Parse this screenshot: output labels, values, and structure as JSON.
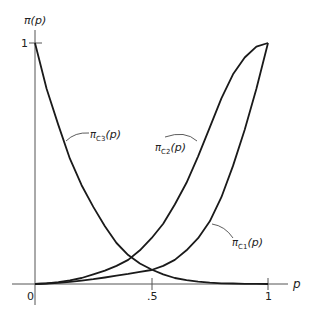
{
  "chart_data": {
    "type": "line",
    "title": "",
    "xlabel": "p",
    "ylabel": "π(p)",
    "xlim": [
      0,
      1
    ],
    "ylim": [
      0,
      1
    ],
    "grid": false,
    "legend": "inline labels with leader arrows",
    "x_ticks": [
      "0",
      ".5",
      "1"
    ],
    "y_ticks": [
      "1"
    ],
    "x": [
      0,
      0.05,
      0.1,
      0.15,
      0.2,
      0.25,
      0.3,
      0.35,
      0.4,
      0.45,
      0.5,
      0.55,
      0.6,
      0.65,
      0.7,
      0.75,
      0.8,
      0.85,
      0.9,
      0.95,
      1.0
    ],
    "series": [
      {
        "name": "π_C3(p)",
        "label_main": "π",
        "label_sub": "C3",
        "label_tail": "(p)",
        "values": [
          1.0,
          0.81,
          0.66,
          0.52,
          0.41,
          0.32,
          0.24,
          0.17,
          0.12,
          0.085,
          0.06,
          0.04,
          0.025,
          0.016,
          0.01,
          0.006,
          0.003,
          0.002,
          0.001,
          0.0005,
          0.0
        ]
      },
      {
        "name": "π_C2(p)",
        "label_main": "π",
        "label_sub": "C2",
        "label_tail": "(p)",
        "values": [
          0.0,
          0.003,
          0.008,
          0.015,
          0.025,
          0.04,
          0.055,
          0.075,
          0.1,
          0.14,
          0.19,
          0.25,
          0.33,
          0.42,
          0.53,
          0.65,
          0.77,
          0.87,
          0.94,
          0.985,
          1.0
        ]
      },
      {
        "name": "π_C1(p)",
        "label_main": "π",
        "label_sub": "C1",
        "label_tail": "(p)",
        "values": [
          0.0,
          0.002,
          0.005,
          0.009,
          0.014,
          0.02,
          0.027,
          0.035,
          0.042,
          0.05,
          0.058,
          0.075,
          0.1,
          0.14,
          0.19,
          0.26,
          0.36,
          0.49,
          0.64,
          0.81,
          1.0
        ]
      }
    ],
    "annotations": [
      "π_C3(p)",
      "π_C2(p)",
      "π_C1(p)"
    ]
  },
  "axes": {
    "y_label": "π(p)",
    "x_label": "p",
    "x_tick_0": "0",
    "x_tick_half": ".5",
    "x_tick_1": "1",
    "y_tick_1": "1"
  }
}
